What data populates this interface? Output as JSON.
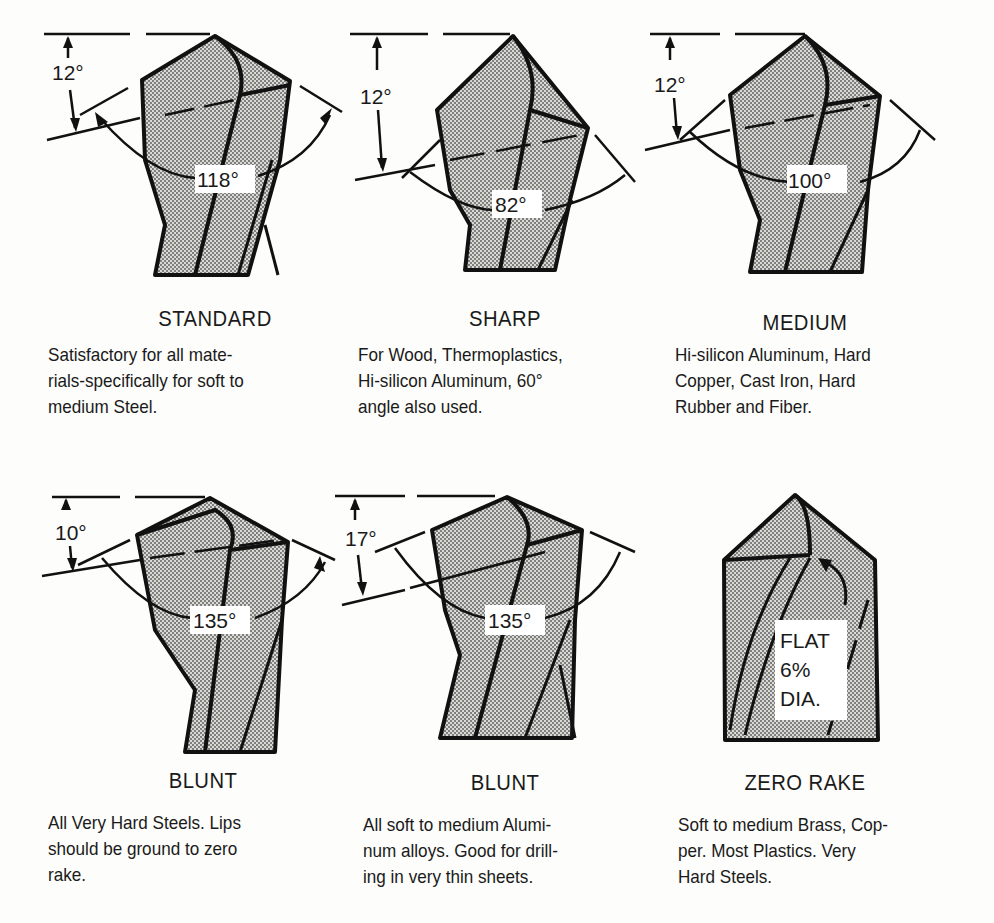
{
  "drills": [
    {
      "name": "STANDARD",
      "point_angle": "118°",
      "lip_angle": "12°",
      "description": "Satisfactory for all materials-specifically for soft to medium Steel.",
      "lines": [
        "Satisfactory for all mate-",
        "rials-specifically for soft to",
        "medium Steel."
      ]
    },
    {
      "name": "SHARP",
      "point_angle": "82°",
      "lip_angle": "12°",
      "description": "For Wood, Thermoplastics, Hi-silicon Aluminum, 60° angle also used.",
      "lines": [
        "For Wood, Thermoplastics,",
        "Hi-silicon Aluminum, 60°",
        "angle also used."
      ]
    },
    {
      "name": "MEDIUM",
      "point_angle": "100°",
      "lip_angle": "12°",
      "description": "Hi-silicon Aluminum, Hard Copper, Cast Iron, Hard Rubber and Fiber.",
      "lines": [
        "Hi-silicon Aluminum, Hard",
        "Copper, Cast Iron, Hard",
        "Rubber and Fiber."
      ]
    },
    {
      "name": "BLUNT",
      "point_angle": "135°",
      "lip_angle": "10°",
      "description": "All Very Hard Steels. Lips should be ground to zero rake.",
      "lines": [
        "All Very Hard Steels. Lips",
        "should be ground to zero",
        "rake."
      ]
    },
    {
      "name": "BLUNT",
      "point_angle": "135°",
      "lip_angle": "17°",
      "description": "All soft to medium Aluminum alloys. Good for drilling in very thin sheets.",
      "lines": [
        "All soft to medium Alumi-",
        "num alloys. Good for drill-",
        "ing in very thin sheets."
      ]
    },
    {
      "name": "ZERO RAKE",
      "flat_label": [
        "FLAT",
        "6%",
        "DIA."
      ],
      "description": "Soft to medium Brass, Copper. Most Plastics. Very Hard Steels.",
      "lines": [
        "Soft to medium Brass, Cop-",
        "per.  Most  Plastics.  Very",
        "Hard Steels."
      ]
    }
  ]
}
